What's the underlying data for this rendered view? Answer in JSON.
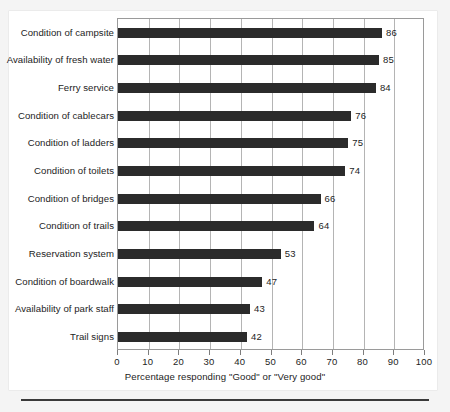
{
  "chart_data": {
    "type": "bar",
    "orientation": "horizontal",
    "title": "",
    "subtitle": "",
    "xlabel": "Percentage responding \"Good\" or \"Very good\"",
    "ylabel": "",
    "xlim": [
      0,
      100
    ],
    "xticks": [
      0,
      10,
      20,
      30,
      40,
      50,
      60,
      70,
      80,
      90,
      100
    ],
    "xtick_labels": [
      "0",
      "10",
      "20",
      "30",
      "40",
      "50",
      "60",
      "70",
      "80",
      "90",
      "100"
    ],
    "grid": "vertical",
    "legend": "none",
    "bar_color": "#2b2b2b",
    "categories": [
      "Condition of campsite",
      "Availability of fresh water",
      "Ferry service",
      "Condition of cablecars",
      "Condition of ladders",
      "Condition of toilets",
      "Condition of bridges",
      "Condition of trails",
      "Reservation system",
      "Condition of boardwalk",
      "Availability of park staff",
      "Trail signs"
    ],
    "values": [
      86,
      85,
      84,
      76,
      75,
      74,
      66,
      64,
      53,
      47,
      43,
      42
    ],
    "data_labels": [
      "86",
      "85",
      "84",
      "76",
      "75",
      "74",
      "66",
      "64",
      "53",
      "47",
      "43",
      "42"
    ]
  }
}
